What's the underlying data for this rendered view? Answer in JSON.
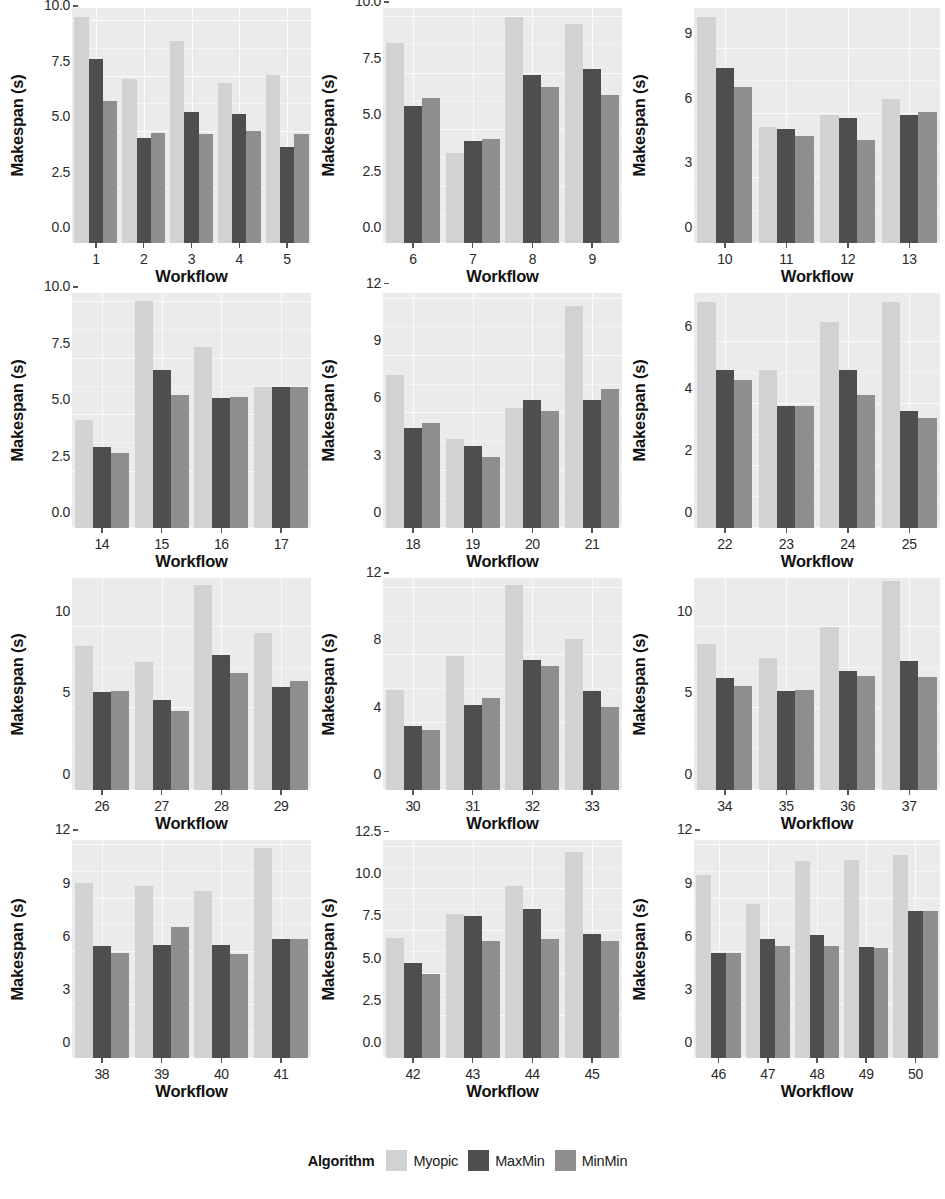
{
  "chart_data": {
    "type": "bar",
    "title": "",
    "xlabel": "Workflow",
    "ylabel": "Makespan (s)",
    "grid": true,
    "legend_position": "bottom",
    "legend_title": "Algorithm",
    "series_names": [
      "Myopic",
      "MaxMin",
      "MinMin"
    ],
    "series_colors": {
      "Myopic": "#d2d2d2",
      "MaxMin": "#4e4e4e",
      "MinMin": "#8e8e8e"
    },
    "facet_layout": {
      "rows": 4,
      "cols": 3
    },
    "panels": [
      {
        "id": "panel-1",
        "categories": [
          "1",
          "2",
          "3",
          "4",
          "5"
        ],
        "ylim": [
          0,
          10.6
        ],
        "yticks": [
          "0.0",
          "2.5",
          "5.0",
          "7.5",
          "10.0"
        ],
        "ytick_values": [
          0,
          2.5,
          5.0,
          7.5,
          10.0
        ],
        "series": [
          {
            "name": "Myopic",
            "values": [
              10.2,
              7.4,
              9.1,
              7.2,
              7.6
            ]
          },
          {
            "name": "MaxMin",
            "values": [
              8.3,
              4.75,
              5.9,
              5.8,
              4.35
            ]
          },
          {
            "name": "MinMin",
            "values": [
              6.4,
              4.95,
              4.9,
              5.05,
              4.9
            ]
          }
        ]
      },
      {
        "id": "panel-2",
        "categories": [
          "6",
          "7",
          "8",
          "9"
        ],
        "ylim": [
          0,
          10.4
        ],
        "yticks": [
          "0.0",
          "2.5",
          "5.0",
          "7.5",
          "10.0"
        ],
        "ytick_values": [
          0,
          2.5,
          5.0,
          7.5,
          10.0
        ],
        "series": [
          {
            "name": "Myopic",
            "values": [
              8.85,
              4.0,
              10.0,
              9.7
            ]
          },
          {
            "name": "MaxMin",
            "values": [
              6.05,
              4.5,
              7.45,
              7.7
            ]
          },
          {
            "name": "MinMin",
            "values": [
              6.4,
              4.6,
              6.9,
              6.55
            ]
          }
        ]
      },
      {
        "id": "panel-3",
        "categories": [
          "10",
          "11",
          "12",
          "13"
        ],
        "ylim": [
          0,
          10.9
        ],
        "yticks": [
          "0",
          "3",
          "6",
          "9"
        ],
        "ytick_values": [
          0,
          3,
          6,
          9
        ],
        "series": [
          {
            "name": "Myopic",
            "values": [
              10.5,
              5.4,
              5.95,
              6.7
            ]
          },
          {
            "name": "MaxMin",
            "values": [
              8.1,
              5.3,
              5.8,
              5.95
            ]
          },
          {
            "name": "MinMin",
            "values": [
              7.25,
              4.95,
              4.8,
              6.1
            ]
          }
        ]
      },
      {
        "id": "panel-4",
        "categories": [
          "14",
          "15",
          "16",
          "17"
        ],
        "ylim": [
          0,
          10.4
        ],
        "yticks": [
          "0.0",
          "2.5",
          "5.0",
          "7.5",
          "10.0"
        ],
        "ytick_values": [
          0,
          2.5,
          5.0,
          7.5,
          10.0
        ],
        "series": [
          {
            "name": "Myopic",
            "values": [
              4.8,
              10.05,
              8.0,
              6.25
            ]
          },
          {
            "name": "MaxMin",
            "values": [
              3.6,
              7.0,
              5.75,
              6.25
            ]
          },
          {
            "name": "MinMin",
            "values": [
              3.3,
              5.9,
              5.8,
              6.25
            ]
          }
        ]
      },
      {
        "id": "panel-5",
        "categories": [
          "18",
          "19",
          "20",
          "21"
        ],
        "ylim": [
          0,
          12.3
        ],
        "yticks": [
          "0",
          "3",
          "6",
          "9",
          "12"
        ],
        "ytick_values": [
          0,
          3,
          6,
          9,
          12
        ],
        "series": [
          {
            "name": "Myopic",
            "values": [
              8.0,
              4.65,
              6.3,
              11.6
            ]
          },
          {
            "name": "MaxMin",
            "values": [
              5.25,
              4.3,
              6.7,
              6.7
            ]
          },
          {
            "name": "MinMin",
            "values": [
              5.5,
              3.7,
              6.15,
              7.25
            ]
          }
        ]
      },
      {
        "id": "panel-6",
        "categories": [
          "22",
          "23",
          "24",
          "25"
        ],
        "ylim": [
          0,
          7.6
        ],
        "yticks": [
          "0",
          "2",
          "4",
          "6"
        ],
        "ytick_values": [
          0,
          2,
          4,
          6
        ],
        "series": [
          {
            "name": "Myopic",
            "values": [
              7.3,
              5.1,
              6.65,
              7.3
            ]
          },
          {
            "name": "MaxMin",
            "values": [
              5.1,
              3.95,
              5.1,
              3.8
            ]
          },
          {
            "name": "MinMin",
            "values": [
              4.8,
              3.95,
              4.3,
              3.55
            ]
          }
        ]
      },
      {
        "id": "panel-7",
        "categories": [
          "26",
          "27",
          "28",
          "29"
        ],
        "ylim": [
          0,
          13.0
        ],
        "yticks": [
          "0",
          "5",
          "10"
        ],
        "ytick_values": [
          0,
          5,
          10
        ],
        "series": [
          {
            "name": "Myopic",
            "values": [
              8.85,
              7.85,
              12.6,
              9.65
            ]
          },
          {
            "name": "MaxMin",
            "values": [
              6.0,
              5.55,
              8.3,
              6.3
            ]
          },
          {
            "name": "MinMin",
            "values": [
              6.05,
              4.85,
              7.2,
              6.7
            ]
          }
        ]
      },
      {
        "id": "panel-8",
        "categories": [
          "30",
          "31",
          "32",
          "33"
        ],
        "ylim": [
          0,
          12.6
        ],
        "yticks": [
          "0",
          "4",
          "8",
          "12"
        ],
        "ytick_values": [
          0,
          4,
          8,
          12
        ],
        "series": [
          {
            "name": "Myopic",
            "values": [
              5.95,
              7.95,
              12.2,
              8.95
            ]
          },
          {
            "name": "MaxMin",
            "values": [
              3.8,
              5.05,
              7.75,
              5.9
            ]
          },
          {
            "name": "MinMin",
            "values": [
              3.55,
              5.45,
              7.4,
              4.95
            ]
          }
        ]
      },
      {
        "id": "panel-9",
        "categories": [
          "34",
          "35",
          "36",
          "37"
        ],
        "ylim": [
          0,
          13.0
        ],
        "yticks": [
          "0",
          "5",
          "10"
        ],
        "ytick_values": [
          0,
          5,
          10
        ],
        "series": [
          {
            "name": "Myopic",
            "values": [
              8.95,
              8.1,
              10.0,
              12.8
            ]
          },
          {
            "name": "MaxMin",
            "values": [
              6.85,
              6.1,
              7.3,
              7.9
            ]
          },
          {
            "name": "MinMin",
            "values": [
              6.4,
              6.15,
              7.0,
              6.9
            ]
          }
        ]
      },
      {
        "id": "panel-10",
        "categories": [
          "38",
          "39",
          "40",
          "41"
        ],
        "ylim": [
          0,
          12.3
        ],
        "yticks": [
          "0",
          "3",
          "6",
          "9",
          "12"
        ],
        "ytick_values": [
          0,
          3,
          6,
          9,
          12
        ],
        "series": [
          {
            "name": "Myopic",
            "values": [
              9.85,
              9.7,
              9.45,
              11.85
            ]
          },
          {
            "name": "MaxMin",
            "values": [
              6.3,
              6.35,
              6.35,
              6.7
            ]
          },
          {
            "name": "MinMin",
            "values": [
              5.9,
              7.4,
              5.85,
              6.7
            ]
          }
        ]
      },
      {
        "id": "panel-11",
        "categories": [
          "42",
          "43",
          "44",
          "45"
        ],
        "ylim": [
          0,
          12.9
        ],
        "yticks": [
          "0.0",
          "2.5",
          "5.0",
          "7.5",
          "10.0",
          "12.5"
        ],
        "ytick_values": [
          0,
          2.5,
          5.0,
          7.5,
          10.0,
          12.5
        ],
        "series": [
          {
            "name": "Myopic",
            "values": [
              7.1,
              8.5,
              10.2,
              12.2
            ]
          },
          {
            "name": "MaxMin",
            "values": [
              5.65,
              8.4,
              8.8,
              7.35
            ]
          },
          {
            "name": "MinMin",
            "values": [
              4.95,
              6.95,
              7.05,
              6.95
            ]
          }
        ]
      },
      {
        "id": "panel-12",
        "categories": [
          "46",
          "47",
          "48",
          "49",
          "50"
        ],
        "ylim": [
          0,
          12.3
        ],
        "yticks": [
          "0",
          "3",
          "6",
          "9",
          "12"
        ],
        "ytick_values": [
          0,
          3,
          6,
          9,
          12
        ],
        "series": [
          {
            "name": "Myopic",
            "values": [
              10.35,
              8.7,
              11.1,
              11.2,
              11.45
            ]
          },
          {
            "name": "MaxMin",
            "values": [
              5.9,
              6.7,
              6.95,
              6.25,
              8.3
            ]
          },
          {
            "name": "MinMin",
            "values": [
              5.9,
              6.3,
              6.3,
              6.2,
              8.3
            ]
          }
        ]
      }
    ]
  },
  "legend": {
    "title": "Algorithm",
    "items": [
      {
        "label": "Myopic",
        "color": "#d2d2d2",
        "key": "myopic"
      },
      {
        "label": "MaxMin",
        "color": "#4e4e4e",
        "key": "maxmin"
      },
      {
        "label": "MinMin",
        "color": "#8e8e8e",
        "key": "minmin"
      }
    ]
  }
}
